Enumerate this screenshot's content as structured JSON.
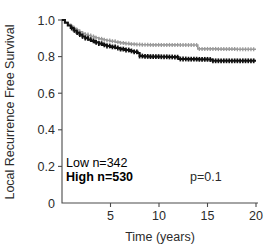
{
  "chart_data": {
    "type": "line",
    "title": "",
    "xlabel": "Time (years)",
    "ylabel": "Local Recurrence Free Survival",
    "xlim": [
      0,
      20
    ],
    "ylim": [
      0,
      1.0
    ],
    "xticks": [
      "5",
      "10",
      "15",
      "20"
    ],
    "xtick_values": [
      5,
      10,
      15,
      20
    ],
    "yticks": [
      "0",
      "0.2",
      "0.4",
      "0.6",
      "0.8",
      "1.0"
    ],
    "ytick_values": [
      0,
      0.2,
      0.4,
      0.6,
      0.8,
      1.0
    ],
    "grid": false,
    "legend_position": "lower-left-inside",
    "annotations": {
      "pvalue": "p=0.1",
      "pvalue_x": 15.0,
      "pvalue_y": 0.175
    },
    "series": [
      {
        "name": "Low n=342",
        "label": "Low",
        "n": 342,
        "color": "#9b9b9b",
        "style": "step-with-censor-ticks",
        "x": [
          0,
          0.3,
          0.6,
          0.9,
          1.2,
          1.5,
          1.8,
          2.1,
          2.4,
          2.7,
          3.0,
          3.4,
          3.8,
          4.2,
          4.6,
          5.0,
          5.5,
          6.0,
          6.5,
          7.0,
          7.6,
          8.2,
          9.0,
          10.0,
          11.0,
          12.0,
          13.0,
          13.9,
          14.0,
          15.0,
          16.0,
          17.0,
          18.0,
          19.0,
          20.0
        ],
        "y": [
          1.0,
          0.988,
          0.977,
          0.966,
          0.955,
          0.945,
          0.936,
          0.928,
          0.921,
          0.915,
          0.91,
          0.903,
          0.897,
          0.892,
          0.888,
          0.884,
          0.879,
          0.875,
          0.871,
          0.868,
          0.866,
          0.865,
          0.864,
          0.864,
          0.864,
          0.863,
          0.863,
          0.863,
          0.842,
          0.842,
          0.841,
          0.841,
          0.84,
          0.84,
          0.84
        ]
      },
      {
        "name": "High n=530",
        "label": "High",
        "n": 530,
        "color": "#111111",
        "style": "step-with-censor-ticks",
        "x": [
          0,
          0.3,
          0.6,
          0.9,
          1.2,
          1.5,
          1.8,
          2.1,
          2.4,
          2.7,
          3.0,
          3.4,
          3.8,
          4.2,
          4.6,
          5.0,
          5.5,
          6.0,
          6.5,
          7.0,
          7.4,
          7.8,
          8.0,
          8.4,
          9.0,
          10.0,
          11.0,
          11.6,
          12.0,
          13.0,
          14.0,
          15.0,
          15.5,
          16.0,
          17.0,
          18.0,
          19.0,
          20.0
        ],
        "y": [
          1.0,
          0.985,
          0.97,
          0.956,
          0.943,
          0.931,
          0.92,
          0.91,
          0.901,
          0.893,
          0.886,
          0.878,
          0.871,
          0.864,
          0.858,
          0.853,
          0.847,
          0.841,
          0.836,
          0.831,
          0.826,
          0.82,
          0.803,
          0.801,
          0.8,
          0.799,
          0.798,
          0.797,
          0.787,
          0.786,
          0.785,
          0.784,
          0.777,
          0.777,
          0.777,
          0.777,
          0.777,
          0.777
        ]
      }
    ]
  },
  "legend": {
    "low_text": "Low n=342",
    "high_text": "High n=530",
    "low_color": "#9b9b9b",
    "high_color": "#111111"
  },
  "axes": {
    "x_title": "Time (years)",
    "y_title": "Local Recurrence Free Survival",
    "axis_color": "#4a4a4a",
    "text_color": "#2b2b2b"
  }
}
